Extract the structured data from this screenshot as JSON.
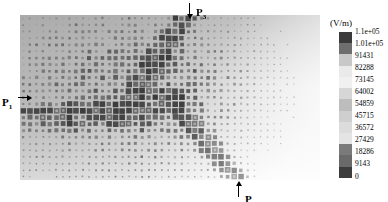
{
  "figure": {
    "type": "field-magnitude-scatter-map",
    "background": "#ffffff"
  },
  "plot": {
    "region_fill": "#b9b9b9",
    "x": 20,
    "y": 15,
    "width": 300,
    "height": 165
  },
  "annotations": [
    {
      "id": "p3",
      "label": "P",
      "sub": "3",
      "arrow": "down",
      "text_x": 196,
      "text_y": 2,
      "arrow_x": 189,
      "arrow_y": 3,
      "arrow_len": 12
    },
    {
      "id": "p1",
      "label": "P",
      "sub": "1",
      "arrow": "right",
      "text_x": 2,
      "text_y": 92,
      "arrow_x": 18,
      "arrow_y": 97,
      "arrow_len": 10
    },
    {
      "id": "p2",
      "label": "P",
      "sub": "2",
      "arrow": "up",
      "text_x": 245,
      "text_y": 189,
      "arrow_x": 238,
      "arrow_y": 185,
      "arrow_len": 12
    }
  ],
  "legend": {
    "title": "(V/m)",
    "orientation": "vertical",
    "colors": [
      "#3a3a3a",
      "#6e6e6e",
      "#c8c8c8",
      "#eaeaea",
      "#f0f0f0",
      "#d6d6d6",
      "#bdbdbd",
      "#cfcfcf",
      "#dcdcdc",
      "#e4e4e4",
      "#7a7a7a",
      "#6a6a6a",
      "#3c3c3c"
    ],
    "ticks": [
      "1.1e+05",
      "1.01e+05",
      "91431",
      "82288",
      "73145",
      "64002",
      "54859",
      "45715",
      "36572",
      "27429",
      "18286",
      "9143",
      "0"
    ]
  },
  "chart_data": {
    "type": "heatmap",
    "title": "",
    "xlabel": "",
    "ylabel": "",
    "unit": "V/m",
    "colorbar_label": "(V/m)",
    "colorbar_ticks": [
      110000,
      101000,
      91431,
      82288,
      73145,
      64002,
      54859,
      45715,
      36572,
      27429,
      18286,
      9143,
      0
    ],
    "value_min": 0,
    "value_max": 110000,
    "grid": false,
    "legend_position": "right",
    "markers": "variable-size squares (bubble map); size and darkness encode |E|",
    "annotated_points": [
      {
        "name": "P1",
        "side": "left",
        "note": "horizontal feed line entry, mid-left edge"
      },
      {
        "name": "P2",
        "side": "bottom",
        "note": "bottom, right-of-center"
      },
      {
        "name": "P3",
        "side": "top",
        "note": "top, center"
      }
    ],
    "hotspot_paths": [
      {
        "name": "P1 horizontal trace",
        "description": "strong row of markers running right from P1 across the left half at ~y=58% height"
      },
      {
        "name": "diagonal branch to P3",
        "description": "bright diagonal band rising from the P1 trace centre toward P3 at the top-centre"
      },
      {
        "name": "diagonal branch to P2",
        "description": "bright staircase descending from centre toward P2 at the bottom-right"
      }
    ]
  }
}
